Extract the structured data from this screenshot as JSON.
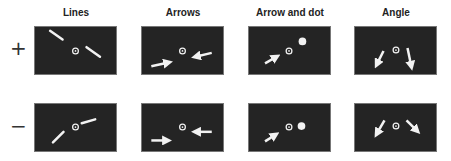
{
  "figure": {
    "columns": [
      {
        "title": "Lines"
      },
      {
        "title": "Arrows"
      },
      {
        "title": "Arrow and dot"
      },
      {
        "title": "Angle"
      }
    ],
    "rows": [
      {
        "label": "+"
      },
      {
        "label": "−"
      }
    ],
    "colors": {
      "panel_background": "#242424",
      "stimulus": "#f2f2f2",
      "page_background": "#ffffff"
    }
  }
}
